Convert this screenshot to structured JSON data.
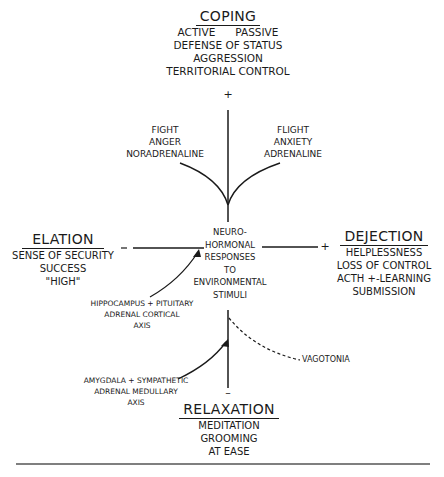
{
  "diagram": {
    "top": {
      "title": "COPING",
      "lines": [
        "ACTIVE      PASSIVE",
        "DEFENSE OF STATUS",
        "AGGRESSION",
        "TERRITORIAL CONTROL"
      ],
      "sign": "+"
    },
    "fight": {
      "lines": [
        "FIGHT",
        "ANGER",
        "NORADRENALINE"
      ]
    },
    "flight": {
      "lines": [
        "FLIGHT",
        "ANXIETY",
        "ADRENALINE"
      ]
    },
    "center": {
      "lines": [
        "NEURO-",
        "HORMONAL",
        "RESPONSES",
        "TO",
        "ENVIRONMENTAL",
        "STIMULI"
      ]
    },
    "left": {
      "title": "ELATION",
      "lines": [
        "SENSE OF SECURITY",
        "SUCCESS",
        "\"HIGH\""
      ],
      "sign": "–"
    },
    "right": {
      "title": "DEJECTION",
      "lines": [
        "HELPLESSNESS",
        "LOSS OF CONTROL",
        "ACTH +-LEARNING",
        "SUBMISSION"
      ],
      "sign": "+"
    },
    "hpa": {
      "lines": [
        "HIPPOCAMPUS + PITUITARY",
        "ADRENAL CORTICAL",
        "AXIS"
      ]
    },
    "sam": {
      "lines": [
        "AMYGDALA + SYMPATHETIC",
        "ADRENAL MEDULLARY",
        "AXIS"
      ]
    },
    "vagotonia": "VAGOTONIA",
    "bottom": {
      "title": "RELAXATION",
      "lines": [
        "MEDITATION",
        "GROOMING",
        "AT EASE"
      ],
      "sign": "–"
    }
  }
}
